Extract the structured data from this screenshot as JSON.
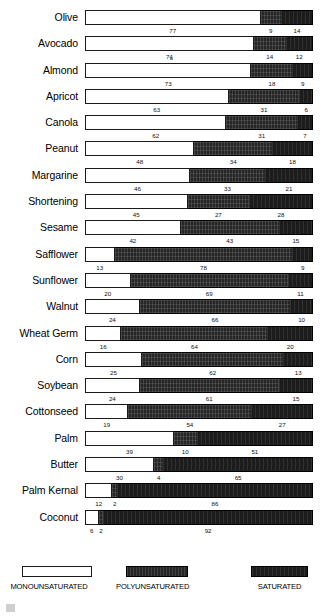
{
  "chart_data": {
    "type": "bar",
    "subtype": "stacked-horizontal-100pct",
    "title": "",
    "xlabel": "",
    "ylabel": "",
    "xlim": [
      0,
      100
    ],
    "grid": false,
    "legend_position": "bottom",
    "categories": [
      "Olive",
      "Avocado",
      "Almond",
      "Apricot",
      "Canola",
      "Peanut",
      "Margarine",
      "Shortening",
      "Sesame",
      "Safflower",
      "Sunflower",
      "Walnut",
      "Wheat Germ",
      "Corn",
      "Soybean",
      "Cottonseed",
      "Palm",
      "Butter",
      "Palm Kernal",
      "Coconut"
    ],
    "series": [
      {
        "name": "MONOUNSATURATED",
        "key": "mono",
        "values": [
          77,
          74,
          73,
          63,
          62,
          48,
          46,
          45,
          42,
          13,
          20,
          24,
          16,
          25,
          24,
          19,
          39,
          30,
          12,
          6
        ]
      },
      {
        "name": "POLYUNSATURATED",
        "key": "poly",
        "values": [
          9,
          14,
          18,
          31,
          31,
          34,
          33,
          27,
          43,
          78,
          69,
          66,
          64,
          62,
          61,
          54,
          10,
          4,
          2,
          2
        ]
      },
      {
        "name": "SATURATED",
        "key": "sat",
        "values": [
          14,
          12,
          9,
          6,
          7,
          18,
          21,
          28,
          15,
          9,
          11,
          10,
          20,
          13,
          15,
          27,
          51,
          65,
          86,
          92
        ]
      }
    ],
    "legend": [
      {
        "label": "MONOUNSATURATED",
        "key": "mono",
        "swatch": "white-outline"
      },
      {
        "label": "POLYUNSATURATED",
        "key": "poly",
        "swatch": "dark-textured"
      },
      {
        "label": "SATURATED",
        "key": "sat",
        "swatch": "dark-solid"
      }
    ]
  }
}
